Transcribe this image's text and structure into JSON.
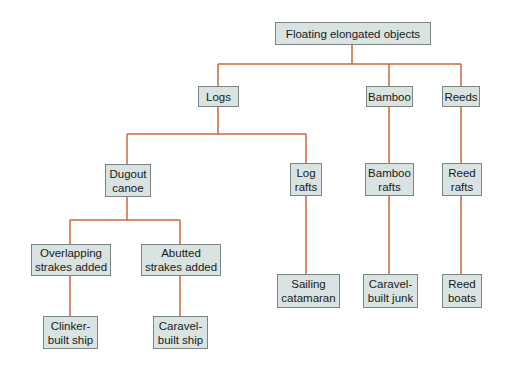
{
  "diagram": {
    "type": "tree",
    "line_color": "#c8673a",
    "box_fill": "#d9e3e1",
    "box_border": "#7d8584",
    "nodes": {
      "root": {
        "label": "Floating elongated objects"
      },
      "logs": {
        "label": "Logs"
      },
      "bamboo": {
        "label": "Bamboo"
      },
      "reeds": {
        "label": "Reeds"
      },
      "dugout": {
        "label": "Dugout\ncanoe"
      },
      "log_rafts": {
        "label": "Log\nrafts"
      },
      "bamboo_rafts": {
        "label": "Bamboo\nrafts"
      },
      "reed_rafts": {
        "label": "Reed\nrafts"
      },
      "overlapping": {
        "label": "Overlapping\nstrakes added"
      },
      "abutted": {
        "label": "Abutted\nstrakes added"
      },
      "catamaran": {
        "label": "Sailing\ncatamaran"
      },
      "junk": {
        "label": "Caravel-\nbuilt junk"
      },
      "reed_boats": {
        "label": "Reed\nboats"
      },
      "clinker": {
        "label": "Clinker-\nbuilt ship"
      },
      "caravel_ship": {
        "label": "Caravel-\nbuilt ship"
      }
    },
    "edges": [
      [
        "root",
        "logs"
      ],
      [
        "root",
        "bamboo"
      ],
      [
        "root",
        "reeds"
      ],
      [
        "logs",
        "dugout"
      ],
      [
        "logs",
        "log_rafts"
      ],
      [
        "bamboo",
        "bamboo_rafts"
      ],
      [
        "reeds",
        "reed_rafts"
      ],
      [
        "dugout",
        "overlapping"
      ],
      [
        "dugout",
        "abutted"
      ],
      [
        "log_rafts",
        "catamaran"
      ],
      [
        "bamboo_rafts",
        "junk"
      ],
      [
        "reed_rafts",
        "reed_boats"
      ],
      [
        "overlapping",
        "clinker"
      ],
      [
        "abutted",
        "caravel_ship"
      ]
    ]
  }
}
